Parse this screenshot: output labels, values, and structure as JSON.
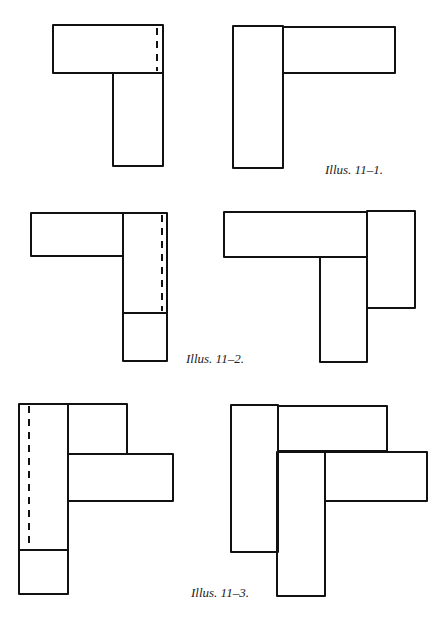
{
  "page": {
    "width": 440,
    "height": 624,
    "background": "#ffffff",
    "stroke": "#111111"
  },
  "figures": [
    {
      "id": "11-1",
      "caption": "Illus. 11–1.",
      "caption_pos": [
        325,
        162
      ],
      "panels": [
        {
          "name": "left",
          "rects": [
            [
              53,
              25,
              110,
              48
            ],
            [
              113,
              73,
              50,
              93
            ]
          ],
          "dashed": [
            [
              157,
              28,
              157,
              71
            ]
          ]
        },
        {
          "name": "right",
          "rects": [
            [
              233,
              26,
              50,
              142
            ],
            [
              283,
              27,
              112,
              46
            ]
          ],
          "dashed": []
        }
      ]
    },
    {
      "id": "11-2",
      "caption": "Illus. 11–2.",
      "caption_pos": [
        186,
        351
      ],
      "panels": [
        {
          "name": "left",
          "rects": [
            [
              31,
              213,
              92,
              43
            ],
            [
              123,
              213,
              44,
              100
            ],
            [
              123,
              313,
              44,
              48
            ]
          ],
          "dashed": [
            [
              162,
              215,
              162,
              311
            ]
          ]
        },
        {
          "name": "right",
          "rects": [
            [
              224,
              212,
              143,
              45
            ],
            [
              367,
              211,
              48,
              97
            ],
            [
              320,
              257,
              47,
              105
            ]
          ],
          "dashed": []
        }
      ]
    },
    {
      "id": "11-3",
      "caption": "Illus. 11–3.",
      "caption_pos": [
        191,
        585
      ],
      "panels": [
        {
          "name": "left",
          "rects": [
            [
              19,
              404,
              49,
              146
            ],
            [
              19,
              550,
              49,
              44
            ],
            [
              68,
              404,
              59,
              50
            ],
            [
              68,
              454,
              105,
              47
            ]
          ],
          "dashed": [
            [
              29,
              406,
              29,
              549
            ]
          ]
        },
        {
          "name": "right",
          "rects": [
            [
              231,
              405,
              47,
              147
            ],
            [
              278,
              406,
              109,
              45
            ],
            [
              277,
              452,
              48,
              144
            ],
            [
              325,
              452,
              102,
              49
            ]
          ],
          "dashed": []
        }
      ]
    }
  ]
}
